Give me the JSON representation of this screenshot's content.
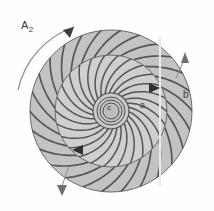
{
  "figure": {
    "kind": "technical-line-diagram",
    "background": "#fefefe",
    "ink": "#4a4a4a",
    "fill_outer": "#c3c3c3",
    "fill_inner": "#cfcfcf",
    "fill_hub": "#c9c9c9",
    "arrow_color": "#6f6f6f"
  },
  "labels": {
    "rotation": {
      "text": "A",
      "sub": "2",
      "x": 21,
      "y": 20
    },
    "a": {
      "text": "a",
      "x": 140,
      "y": 101
    },
    "b": {
      "text": "b",
      "x": 183,
      "y": 90
    },
    "c": {
      "text": "c",
      "x": 107,
      "y": 104
    }
  },
  "geometry": {
    "center": {
      "cx": 111,
      "cy": 111
    },
    "outer_radius": 81,
    "inner_radius": 56,
    "hub_radii": [
      18,
      14,
      11,
      8
    ],
    "outer_blade_count": 26,
    "inner_blade_count": 26
  },
  "annotations": {
    "rotation_arc": {
      "name": "A2-rotation-arrow",
      "direction": "clockwise",
      "from_deg": 200,
      "to_deg": 295
    },
    "leader_top_right": {
      "name": "b-leader-arrow",
      "x": 185,
      "y": 52,
      "points": "up"
    },
    "leader_bottom_left": {
      "name": "lower-leader-arrow",
      "x": 62,
      "y": 192,
      "points": "down"
    },
    "flow_arrow_right": {
      "name": "inner-flow-arrow-right",
      "x": 155,
      "y": 88,
      "points": "right"
    },
    "flow_arrow_left": {
      "name": "inner-flow-arrow-left",
      "x": 79,
      "y": 148,
      "points": "left"
    }
  },
  "chart_data": {
    "type": "diagram",
    "elements": [
      {
        "id": "a",
        "label": "a",
        "description": "inner blade row"
      },
      {
        "id": "b",
        "label": "b",
        "description": "outer blade row"
      },
      {
        "id": "c",
        "label": "c",
        "description": "central hub"
      },
      {
        "id": "A2",
        "label": "A2",
        "description": "rotation direction arrow"
      }
    ]
  }
}
